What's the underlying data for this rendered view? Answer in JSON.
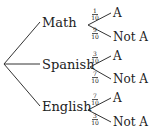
{
  "tree": {
    "branches": [
      {
        "label": "Math",
        "outcomes": [
          {
            "prob_num": "1",
            "prob_den": "10",
            "label": "A"
          },
          {
            "prob_num": "9",
            "prob_den": "10",
            "label": "Not A"
          }
        ]
      },
      {
        "label": "Spanish",
        "outcomes": [
          {
            "prob_num": "3",
            "prob_den": "10",
            "label": "A"
          },
          {
            "prob_num": "7",
            "prob_den": "10",
            "label": "Not A"
          }
        ]
      },
      {
        "label": "English",
        "outcomes": [
          {
            "prob_num": "7",
            "prob_den": "10",
            "label": "A"
          },
          {
            "prob_num": "3",
            "prob_den": "10",
            "label": "Not A"
          }
        ]
      }
    ]
  }
}
